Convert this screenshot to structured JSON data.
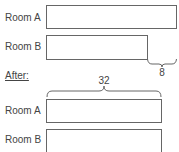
{
  "before": {
    "rows": [
      {
        "label": "Room A",
        "length": 40
      },
      {
        "label": "Room B",
        "length": 32
      }
    ],
    "difference_label": "8"
  },
  "after": {
    "heading": "After:",
    "brace_label": "32",
    "rows": [
      {
        "label": "Room A",
        "length": 32
      },
      {
        "label": "Room B",
        "length": 32
      }
    ]
  }
}
